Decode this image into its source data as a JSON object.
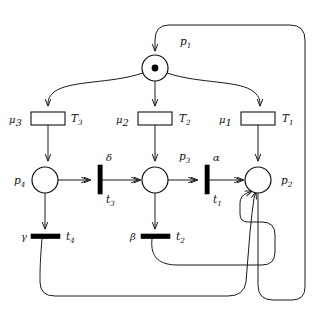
{
  "diagram": {
    "colors": {
      "stroke": "#1a1a1a",
      "place_fill": "#ffffff",
      "token": "#000000",
      "bar_fill": "#000000",
      "background": "#ffffff"
    },
    "places": [
      {
        "id": "p1",
        "label": "p",
        "sub": "1",
        "cx": 155,
        "cy": 68,
        "r": 13,
        "tokens": 1,
        "label_x": 180,
        "label_y": 45
      },
      {
        "id": "p2",
        "label": "p",
        "sub": "2",
        "cx": 258,
        "cy": 180,
        "r": 13,
        "tokens": 0,
        "label_x": 281,
        "label_y": 184
      },
      {
        "id": "p3",
        "label": "p",
        "sub": "3",
        "cx": 155,
        "cy": 180,
        "r": 13,
        "tokens": 0,
        "label_x": 179,
        "label_y": 160
      },
      {
        "id": "p4",
        "label": "p",
        "sub": "4",
        "cx": 45,
        "cy": 180,
        "r": 13,
        "tokens": 0,
        "label_x": 14,
        "label_y": 184
      }
    ],
    "box_transitions": [
      {
        "id": "T1",
        "label": "T",
        "sub": "1",
        "rate_label": "μ",
        "rate_sub": "1",
        "x": 241,
        "y": 112,
        "w": 34,
        "h": 13,
        "name_x": 282,
        "name_y": 122,
        "rate_x": 219,
        "rate_y": 123
      },
      {
        "id": "T2",
        "label": "T",
        "sub": "2",
        "rate_label": "μ",
        "rate_sub": "2",
        "x": 138,
        "y": 112,
        "w": 34,
        "h": 13,
        "name_x": 179,
        "name_y": 122,
        "rate_x": 116,
        "rate_y": 123
      },
      {
        "id": "T3",
        "label": "T",
        "sub": "3",
        "rate_label": "μ",
        "rate_sub": "3",
        "x": 31,
        "y": 112,
        "w": 34,
        "h": 13,
        "name_x": 71,
        "name_y": 122,
        "rate_x": 9,
        "rate_y": 123
      }
    ],
    "bar_transitions": [
      {
        "id": "t1",
        "label": "t",
        "sub": "1",
        "rate_label": "α",
        "orient": "vertical",
        "cx": 207,
        "cy": 180,
        "len": 28,
        "thick": 4,
        "name_x": 213,
        "name_y": 203,
        "rate_x": 213,
        "rate_y": 161
      },
      {
        "id": "t2",
        "label": "t",
        "sub": "2",
        "rate_label": "β",
        "orient": "horizontal",
        "cx": 155,
        "cy": 236,
        "len": 28,
        "thick": 4,
        "name_x": 176,
        "name_y": 240,
        "rate_x": 133,
        "rate_y": 240
      },
      {
        "id": "t3",
        "label": "t",
        "sub": "3",
        "rate_label": "δ",
        "orient": "vertical",
        "cx": 100,
        "cy": 180,
        "len": 28,
        "thick": 4,
        "name_x": 106,
        "name_y": 203,
        "rate_x": 106,
        "rate_y": 161
      },
      {
        "id": "t4",
        "label": "t",
        "sub": "4",
        "rate_label": "γ",
        "orient": "horizontal",
        "cx": 45,
        "cy": 236,
        "len": 28,
        "thick": 4,
        "name_x": 66,
        "name_y": 240,
        "rate_x": 24,
        "rate_y": 240
      }
    ],
    "arcs": [
      {
        "id": "arc-p1-T3",
        "from": "p1",
        "to": "T3"
      },
      {
        "id": "arc-p1-T2",
        "from": "p1",
        "to": "T2"
      },
      {
        "id": "arc-p1-T1",
        "from": "p1",
        "to": "T1"
      },
      {
        "id": "arc-T3-p4",
        "from": "T3",
        "to": "p4"
      },
      {
        "id": "arc-T2-p3",
        "from": "T2",
        "to": "p3"
      },
      {
        "id": "arc-T1-p2",
        "from": "T1",
        "to": "p2"
      },
      {
        "id": "arc-p4-t3",
        "from": "p4",
        "to": "t3"
      },
      {
        "id": "arc-t3-p3",
        "from": "t3",
        "to": "p3"
      },
      {
        "id": "arc-p3-t1",
        "from": "p3",
        "to": "t1"
      },
      {
        "id": "arc-t1-p2",
        "from": "t1",
        "to": "p2"
      },
      {
        "id": "arc-p4-t4",
        "from": "p4",
        "to": "t4"
      },
      {
        "id": "arc-p3-t2",
        "from": "p3",
        "to": "t2"
      },
      {
        "id": "arc-t2-p2",
        "from": "t2",
        "to": "p2"
      },
      {
        "id": "arc-t4-p2",
        "from": "t4",
        "to": "p2"
      },
      {
        "id": "arc-p2-p1",
        "from": "p2",
        "to": "p1"
      }
    ]
  }
}
